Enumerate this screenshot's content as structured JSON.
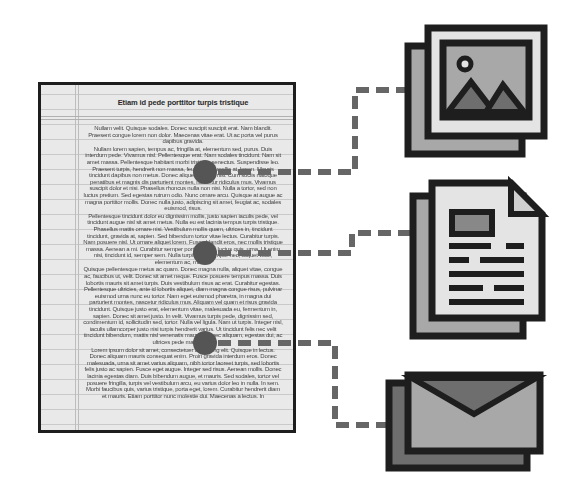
{
  "document": {
    "title": "Etiam id pede porttitor turpis tristique",
    "paragraphs": [
      "Nullam velit. Quisque sodales. Donec suscipit suscipit erat. Nam blandit. Praesent congue lorem non dolor. Maecenas vitae erat. Ut ac porta vel purus dapibus gravida.",
      "Nullam lorem sapien, tempus ac, fringilla at, elementum sed, purus. Duis interdum pede. Vivamus nisl. Pellentesque erat. Nam sodales tincidunt. Nam sit amet massa. Pellentesque habitant morbi tristique senectus. Suspendisse leo. Praesent turpis, hendrerit non massa, feugiat non, mollis at, lorem. Mauris tincidunt dapibus non metus. Donec aliquet diam et nisl. Cum sociis natoque penatibus et magnis dis parturient montes, nascetur ridiculus mus. Vivamus suscipit dolor et nisi. Phasellus rhoncus nulla non nisi. Nulla a tortor, sed non luctus pretium. Sed egestas rutrum odio. Nunc ornare arcu. Quisque at augue ac magna porttitor mollis. Donec nulla justo, adipiscing sit amet, feugiat ac, sodales euismod, risus.",
      "Pellentesque tincidunt dolor eu dignissim mollis, justo sapien iaculis pede, vel tincidunt augue nisl sit amet metus. Nulla eu est lacinia tempus turpis tristique. Phasellus mattis ornare nisi. Vestibulum mollis quam, ultrices in, tincidunt tincidunt, gravida at, sapien. Sed bibendum tortor vitae lectus. Curabitur turpis. Nam posuere nisl. Ut ornare aliquet lorem. Fusce blandit eros, nec mollis tristique massa. Aenean a mi. Curabitur semper porttitor quis, luctus quis, urna. Ut enim nisi, tincidunt id, semper sem. Nulla turpis nibh, tempor nec, aliquet vitae, elementum ac, mauris.",
      "Quisque pellentesque metus ac quam. Donec magna nulla, aliquet vitae, congue ac, faucibus ut, velit. Donec sit amet neque. Fusce posuere tempus massa. Duis lobortis mauris sit amet turpis. Duis vestibulum risus ac erat. Curabitur egestas. Pellentesque ultricies, ante id lobortis aliquet, diam magna congue risus, pulvinar euismod urna nunc eu tortor. Nam eget euismod pharetra, in magna dui parturient montes, nascetur ridiculus mus. Aliquam vel quam et risus gravida tincidunt. Quisque justo erat, elementum vitae, malesuada eu, fermentum in, sapien. Donec sit amet justo. In velit. Vivamus turpis pede, dignissim sed, condimentum id, sollicitudin sed, tortor. Nulla vel ligula. Nam ut turpis. Integer nisl, iaculis ullamcorper justo nisi turpis hendrerit varius. Ut tincidunt felis nec velit tincidunt bibendum, mattis nisl venenatis mauris. Donec aliquam, egestas dui, ac ultrices pede mattis quis.",
      "Lorem ipsum dolor sit amet, consectetuer adipiscing elit. Quisque in lectus. Donec aliquam mauris consequat enim. Proin gravida interdum eros. Donec malesuada, urna sit amet varius aliquam, nibh tortor laoreet turpis, sed lobortis felis justo ac sapien. Fusce eget augue. Integer sed risus. Aenean mollis. Donec lacinia egestas diam. Duis bibendum augue, et mauris. Sed sodales, tortor vel posuere fringilla, turpis vel vestibulum arcu, eu varius dolor leo in nulla. In sem. Morbi faucibus quis, varius tristique, porta eget, lorem. Curabitur hendrerit diam et mauris. Etiam porttitor nunc molestie dui. Maecenas a lectus. In"
    ]
  },
  "bullets": [
    {
      "label": "bullet-1",
      "cx": 205,
      "cy": 172
    },
    {
      "label": "bullet-2",
      "cx": 205,
      "cy": 253
    },
    {
      "label": "bullet-3",
      "cx": 205,
      "cy": 343
    }
  ],
  "icons": [
    {
      "name": "image-gallery-icon",
      "semantic": "stacked photos"
    },
    {
      "name": "document-file-icon",
      "semantic": "stacked text documents"
    },
    {
      "name": "envelope-mail-icon",
      "semantic": "stacked email envelopes"
    }
  ],
  "colors": {
    "outline": "#1e1e1e",
    "bullet": "#555555",
    "connector": "#666666",
    "light_fill": "#e4e4e4",
    "mid_fill": "#a8a8a8",
    "dark_fill": "#6e6e6e",
    "page_bg": "#e9e9e9"
  }
}
